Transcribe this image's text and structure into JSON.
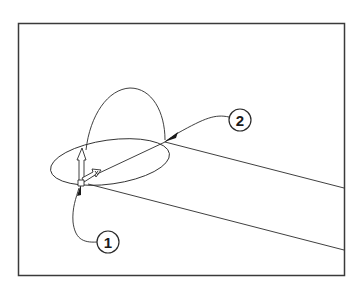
{
  "figure": {
    "frame": {
      "x": 18,
      "y": 23,
      "width": 327,
      "height": 253,
      "stroke": "#3a3a3a"
    },
    "line_color": "#2a2a2a",
    "background": "#ffffff"
  },
  "callouts": [
    {
      "id": "1",
      "label": "1",
      "cx": 108,
      "cy": 242,
      "r": 11
    },
    {
      "id": "2",
      "label": "2",
      "cx": 240,
      "cy": 120,
      "r": 11
    }
  ],
  "triad": {
    "axes": [
      "y-axis-arrow",
      "x-axis-arrow",
      "z-axis-arrow"
    ],
    "origin": {
      "x": 81,
      "y": 183
    }
  }
}
